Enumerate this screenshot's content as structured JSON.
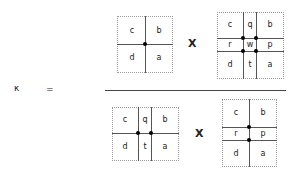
{
  "equation": {
    "lhs": "κ",
    "equals": "=",
    "operator": "X"
  },
  "numerator": {
    "left_box": {
      "cells": [
        "c",
        "b",
        "d",
        "a"
      ],
      "dots": 1
    },
    "right_box": {
      "cells": [
        "c",
        "q",
        "b",
        "r",
        "w",
        "p",
        "d",
        "t",
        "a"
      ],
      "dots": 4
    }
  },
  "denominator": {
    "left_box": {
      "cells": [
        "c",
        "q",
        "b",
        "d",
        "t",
        "a"
      ],
      "dots": 2
    },
    "right_box": {
      "cells": [
        "c",
        "b",
        "r",
        "p",
        "d",
        "a"
      ],
      "dots": 2
    }
  }
}
